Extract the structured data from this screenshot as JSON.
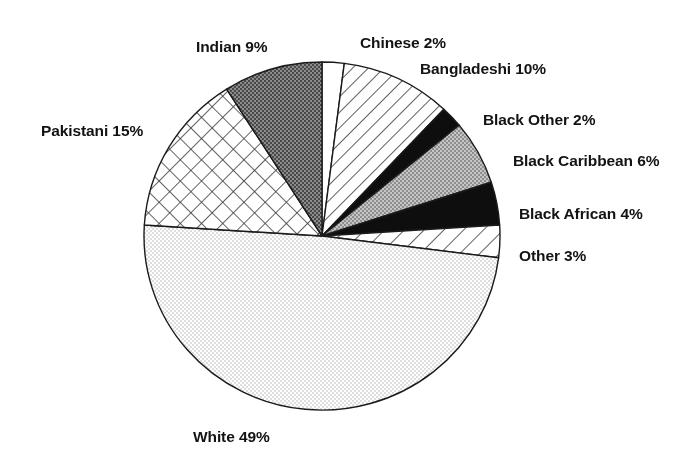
{
  "chart_data": {
    "type": "pie",
    "title": "",
    "subtitle": "",
    "xlabel": "",
    "ylabel": "",
    "legend_position": "none",
    "grid": false,
    "units": "percent",
    "total": 100,
    "start_angle_deg": 0,
    "direction": "clockwise",
    "categories": [
      "Chinese",
      "Bangladeshi",
      "Black Other",
      "Black Caribbean",
      "Black African",
      "Other",
      "White",
      "Pakistani",
      "Indian"
    ],
    "values": [
      2,
      10,
      2,
      6,
      4,
      3,
      49,
      15,
      9
    ],
    "slices": [
      {
        "name": "Chinese",
        "value": 2,
        "label": "Chinese 2%",
        "fill": "white",
        "color": "#ffffff",
        "label_x": 360,
        "label_y": 34,
        "label_anchor": "left"
      },
      {
        "name": "Bangladeshi",
        "value": 10,
        "label": "Bangladeshi 10%",
        "fill": "diagonal-hatch",
        "color": "#ffffff",
        "label_x": 420,
        "label_y": 60,
        "label_anchor": "left"
      },
      {
        "name": "Black Other",
        "value": 2,
        "label": "Black Other 2%",
        "fill": "solid-black",
        "color": "#0d0d0d",
        "label_x": 483,
        "label_y": 111,
        "label_anchor": "left"
      },
      {
        "name": "Black Caribbean",
        "value": 6,
        "label": "Black Caribbean 6%",
        "fill": "medium-gray",
        "color": "#a8a8a8",
        "label_x": 513,
        "label_y": 152,
        "label_anchor": "left"
      },
      {
        "name": "Black African",
        "value": 4,
        "label": "Black African 4%",
        "fill": "solid-black",
        "color": "#111111",
        "label_x": 519,
        "label_y": 205,
        "label_anchor": "left"
      },
      {
        "name": "Other",
        "value": 3,
        "label": "Other 3%",
        "fill": "diagonal-hatch-wide",
        "color": "#ffffff",
        "label_x": 519,
        "label_y": 247,
        "label_anchor": "left"
      },
      {
        "name": "White",
        "value": 49,
        "label": "White 49%",
        "fill": "light-stipple",
        "color": "#e8e8e8",
        "label_x": 193,
        "label_y": 428,
        "label_anchor": "left"
      },
      {
        "name": "Pakistani",
        "value": 15,
        "label": "Pakistani 15%",
        "fill": "cross-hatch",
        "color": "#ffffff",
        "label_x": 41,
        "label_y": 122,
        "label_anchor": "left"
      },
      {
        "name": "Indian",
        "value": 9,
        "label": "Indian 9%",
        "fill": "dark-stipple",
        "color": "#6b6b6b",
        "label_x": 196,
        "label_y": 38,
        "label_anchor": "left"
      }
    ],
    "geometry": {
      "center_x": 322,
      "center_y": 236,
      "radius_x": 178,
      "radius_y": 174
    }
  }
}
